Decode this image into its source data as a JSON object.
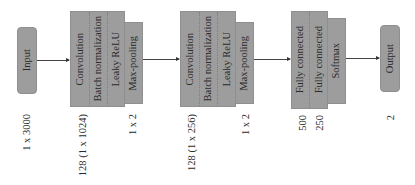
{
  "diagram": {
    "type": "neural-network-architecture",
    "nodes": {
      "input": {
        "label": "Input",
        "dim": "1 x 3000"
      },
      "block1": {
        "layers": [
          "Convolution",
          "Batch normalization",
          "Leaky ReLU"
        ],
        "pool": "Max-pooling",
        "dim": "128 (1 x 1024)",
        "pool_dim": "1 x 2"
      },
      "block2": {
        "layers": [
          "Convolution",
          "Batch normalization",
          "Leaky ReLU"
        ],
        "pool": "Max-pooling",
        "dim": "128 (1 x 256)",
        "pool_dim": "1 x 2"
      },
      "block3": {
        "layers": [
          "Fully connected",
          "Fully connected"
        ],
        "softmax": "Softmax",
        "dims": [
          "500",
          "250"
        ]
      },
      "output": {
        "label": "Output",
        "dim": "2"
      }
    },
    "edges": [
      [
        "input",
        "block1"
      ],
      [
        "block1",
        "block2"
      ],
      [
        "block2",
        "block3"
      ],
      [
        "block3",
        "output"
      ]
    ],
    "colors": {
      "box_fill": "#9d9d9d",
      "text": "#2b2b2b",
      "arrow": "#444444"
    }
  }
}
